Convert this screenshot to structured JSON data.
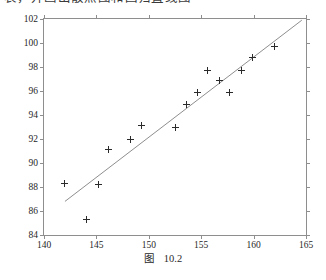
{
  "page": {
    "clipped_top_line": "表，并画出散点图和回归直线图",
    "background_color": "#ffffff"
  },
  "caption": {
    "word": "图",
    "number": "10.2"
  },
  "chart_data": {
    "type": "scatter",
    "title": "",
    "subtitle": "",
    "xlabel": "",
    "ylabel": "",
    "xlim": [
      140,
      165
    ],
    "ylim": [
      84,
      102
    ],
    "xticks": [
      140,
      145,
      150,
      155,
      160,
      165
    ],
    "yticks": [
      84,
      86,
      88,
      90,
      92,
      94,
      96,
      98,
      100,
      102
    ],
    "xtick_labels": [
      "140",
      "145",
      "150",
      "155",
      "160",
      "165"
    ],
    "ytick_labels": [
      "84",
      "86",
      "88",
      "90",
      "92",
      "94",
      "96",
      "98",
      "100",
      "102"
    ],
    "grid": false,
    "legend": null,
    "marker": "plus",
    "marker_color": "#2b2b2b",
    "line_color": "#8e8e8e",
    "frame_color": "#8e8e8e",
    "points": [
      {
        "x": 142.0,
        "y": 88.3
      },
      {
        "x": 144.1,
        "y": 85.3
      },
      {
        "x": 145.2,
        "y": 88.2
      },
      {
        "x": 146.2,
        "y": 91.1
      },
      {
        "x": 148.3,
        "y": 92.0
      },
      {
        "x": 149.3,
        "y": 93.1
      },
      {
        "x": 152.5,
        "y": 93.0
      },
      {
        "x": 153.6,
        "y": 94.9
      },
      {
        "x": 154.6,
        "y": 95.9
      },
      {
        "x": 155.6,
        "y": 97.7
      },
      {
        "x": 156.7,
        "y": 96.9
      },
      {
        "x": 157.7,
        "y": 95.9
      },
      {
        "x": 158.8,
        "y": 97.7
      },
      {
        "x": 159.9,
        "y": 98.8
      },
      {
        "x": 162.0,
        "y": 99.7
      }
    ],
    "fit_line": {
      "name": "regression line",
      "x_start": 142.0,
      "y_start": 86.8,
      "x_end": 164.6,
      "y_end": 101.9
    }
  }
}
